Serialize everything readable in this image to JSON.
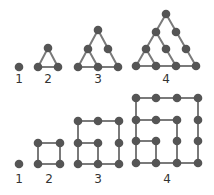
{
  "colors": {
    "line": "#7a7a7a",
    "dot": "#555555",
    "label": "#333333",
    "background": "#ffffff"
  },
  "triangular_numbers": {
    "figures": [
      {
        "label": "1",
        "label_pos": [
          19,
          83
        ],
        "dots": [
          [
            19,
            67
          ]
        ],
        "edges": []
      },
      {
        "label": "2",
        "label_pos": [
          48,
          83
        ],
        "dots": [
          [
            48,
            48
          ],
          [
            38,
            67
          ],
          [
            58,
            67
          ]
        ],
        "edges": [
          [
            [
              48,
              48
            ],
            [
              38,
              67
            ]
          ],
          [
            [
              48,
              48
            ],
            [
              58,
              67
            ]
          ],
          [
            [
              38,
              67
            ],
            [
              58,
              67
            ]
          ]
        ]
      },
      {
        "label": "3",
        "label_pos": [
          98,
          83
        ],
        "dots": [
          [
            98,
            30
          ],
          [
            88,
            49
          ],
          [
            108,
            49
          ],
          [
            78,
            67
          ],
          [
            98,
            67
          ],
          [
            118,
            67
          ]
        ],
        "edges": [
          [
            [
              98,
              30
            ],
            [
              78,
              67
            ]
          ],
          [
            [
              98,
              30
            ],
            [
              118,
              67
            ]
          ],
          [
            [
              78,
              67
            ],
            [
              118,
              67
            ]
          ],
          [
            [
              88,
              49
            ],
            [
              98,
              67
            ]
          ]
        ]
      },
      {
        "label": "4",
        "label_pos": [
          166,
          83
        ],
        "dots": [
          [
            166,
            14
          ],
          [
            156,
            32
          ],
          [
            176,
            32
          ],
          [
            146,
            49
          ],
          [
            166,
            49
          ],
          [
            186,
            49
          ],
          [
            136,
            66
          ],
          [
            156,
            66
          ],
          [
            176,
            66
          ],
          [
            196,
            66
          ]
        ],
        "edges": [
          [
            [
              166,
              14
            ],
            [
              136,
              66
            ]
          ],
          [
            [
              166,
              14
            ],
            [
              196,
              66
            ]
          ],
          [
            [
              136,
              66
            ],
            [
              196,
              66
            ]
          ],
          [
            [
              156,
              32
            ],
            [
              176,
              66
            ]
          ],
          [
            [
              146,
              49
            ],
            [
              156,
              66
            ]
          ]
        ]
      }
    ]
  },
  "square_numbers": {
    "figures": [
      {
        "label": "1",
        "label_pos": [
          19,
          183
        ],
        "dots": [
          [
            19,
            164
          ]
        ],
        "edges": []
      },
      {
        "label": "2",
        "label_pos": [
          49,
          183
        ],
        "dots": [
          [
            38,
            143
          ],
          [
            60,
            143
          ],
          [
            38,
            164
          ],
          [
            60,
            164
          ]
        ],
        "edges": [
          [
            [
              38,
              143
            ],
            [
              60,
              143
            ]
          ],
          [
            [
              60,
              143
            ],
            [
              60,
              164
            ]
          ],
          [
            [
              60,
              164
            ],
            [
              38,
              164
            ]
          ],
          [
            [
              38,
              164
            ],
            [
              38,
              143
            ]
          ]
        ]
      },
      {
        "label": "3",
        "label_pos": [
          98,
          183
        ],
        "dots": [
          [
            78,
            121
          ],
          [
            98,
            121
          ],
          [
            119,
            121
          ],
          [
            78,
            143
          ],
          [
            98,
            143
          ],
          [
            119,
            143
          ],
          [
            78,
            164
          ],
          [
            98,
            164
          ],
          [
            119,
            164
          ]
        ],
        "edges": [
          [
            [
              78,
              121
            ],
            [
              119,
              121
            ]
          ],
          [
            [
              119,
              121
            ],
            [
              119,
              164
            ]
          ],
          [
            [
              119,
              164
            ],
            [
              78,
              164
            ]
          ],
          [
            [
              78,
              164
            ],
            [
              78,
              121
            ]
          ],
          [
            [
              78,
              143
            ],
            [
              98,
              143
            ]
          ],
          [
            [
              98,
              143
            ],
            [
              98,
              164
            ]
          ]
        ]
      },
      {
        "label": "4",
        "label_pos": [
          167,
          183
        ],
        "dots": [
          [
            136,
            98
          ],
          [
            156,
            98
          ],
          [
            177,
            98
          ],
          [
            198,
            98
          ],
          [
            136,
            120
          ],
          [
            156,
            120
          ],
          [
            177,
            120
          ],
          [
            198,
            120
          ],
          [
            136,
            141
          ],
          [
            156,
            141
          ],
          [
            177,
            141
          ],
          [
            198,
            141
          ],
          [
            136,
            163
          ],
          [
            156,
            163
          ],
          [
            177,
            163
          ],
          [
            198,
            163
          ]
        ],
        "edges": [
          [
            [
              136,
              98
            ],
            [
              198,
              98
            ]
          ],
          [
            [
              198,
              98
            ],
            [
              198,
              163
            ]
          ],
          [
            [
              198,
              163
            ],
            [
              136,
              163
            ]
          ],
          [
            [
              136,
              163
            ],
            [
              136,
              98
            ]
          ],
          [
            [
              136,
              120
            ],
            [
              177,
              120
            ]
          ],
          [
            [
              177,
              120
            ],
            [
              177,
              163
            ]
          ],
          [
            [
              136,
              141
            ],
            [
              156,
              141
            ]
          ],
          [
            [
              156,
              141
            ],
            [
              156,
              163
            ]
          ]
        ]
      }
    ]
  }
}
